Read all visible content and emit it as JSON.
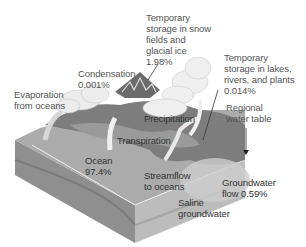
{
  "diagram": {
    "type": "hydrologic-cycle",
    "labels": {
      "snow_storage": "Temporary\nstorage in snow\nfields and\nglacial ice\n1.98%",
      "condensation": "Condensation\n0.001%",
      "lake_storage": "Temporary\nstorage in lakes,\nrivers, and plants\n0.014%",
      "evaporation": "Evaporation\nfrom oceans",
      "regional_water_table": "Regional\nwater table",
      "precipitation": "Precipitation",
      "transpiration": "Transpiration",
      "ocean": "Ocean\n97.4%",
      "streamflow": "Streamflow\nto oceans",
      "groundwater_flow": "Groundwater\nflow 0.59%",
      "saline_groundwater": "Saline\ngroundwater"
    },
    "colors": {
      "background": "#ffffff",
      "block_top": "#a8a8a8",
      "block_side_left": "#8c8c8c",
      "block_side_right": "#bdbdbd",
      "land": "#7a7a7a",
      "cloud": "#ececec",
      "text": "#555555"
    }
  }
}
